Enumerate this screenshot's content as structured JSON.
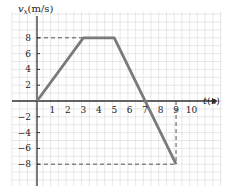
{
  "chart_data": {
    "type": "line",
    "title": "",
    "xlabel": "t(s)",
    "ylabel": "vx(m/s)",
    "ylabel_main": "v",
    "ylabel_sub": "x",
    "ylabel_unit": "(m/s)",
    "xlim": [
      0,
      10
    ],
    "ylim": [
      -8,
      8
    ],
    "grid": true,
    "x_ticks": [
      "1",
      "2",
      "3",
      "4",
      "5",
      "6",
      "7",
      "8",
      "9",
      "10"
    ],
    "y_ticks": [
      "8",
      "6",
      "4",
      "2",
      "-2",
      "-4",
      "-6",
      "-8"
    ],
    "series": [
      {
        "name": "velocity",
        "x": [
          0,
          3,
          5,
          9
        ],
        "values": [
          0,
          8,
          8,
          -8
        ]
      }
    ],
    "guides": [
      {
        "type": "dashed",
        "from": [
          0,
          8
        ],
        "to": [
          3,
          8
        ]
      },
      {
        "type": "dashed",
        "from": [
          0,
          -8
        ],
        "to": [
          9,
          -8
        ]
      },
      {
        "type": "dashed",
        "from": [
          9,
          0
        ],
        "to": [
          9,
          -8
        ]
      }
    ],
    "colors": {
      "line": "#7a7a7a",
      "grid": "#d9d9d9",
      "axis": "#333333"
    }
  }
}
